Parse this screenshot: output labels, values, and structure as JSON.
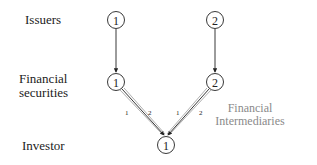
{
  "rows": {
    "issuers": "Issuers",
    "securities_line1": "Financial",
    "securities_line2": "securities",
    "investor": "Investor"
  },
  "nodes": {
    "issuer_1": "1",
    "issuer_2": "2",
    "security_1": "1",
    "security_2": "2",
    "investor_1": "1"
  },
  "edge_labels": {
    "s1_path1": "1",
    "s1_path2": "2",
    "s2_path1": "1",
    "s2_path2": "2"
  },
  "intermediaries": {
    "line1": "Financial",
    "line2": "Intermediaries"
  },
  "colors": {
    "ink": "#222222",
    "gray_text": "#8a8a8a",
    "gray_line": "#9a9a9a"
  }
}
